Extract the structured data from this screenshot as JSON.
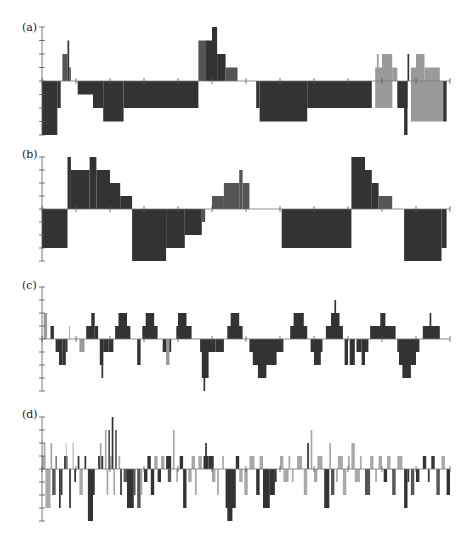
{
  "chart_data": [
    {
      "type": "bar",
      "label": "(a)",
      "xlim": [
        0,
        120
      ],
      "ylim": [
        -4,
        4
      ],
      "x_ticks": [
        0,
        10,
        20,
        30,
        40,
        50,
        60,
        70,
        80,
        90,
        100,
        110,
        120
      ],
      "colors": {
        "dark": "#333333",
        "mid": "#555555",
        "light": "#9a9a9a"
      },
      "segments": [
        [
          0,
          4.5,
          -4,
          "dark"
        ],
        [
          4.5,
          5.5,
          -2,
          "dark"
        ],
        [
          6,
          7.5,
          2,
          "mid"
        ],
        [
          7.5,
          8,
          3,
          "dark"
        ],
        [
          8,
          8.5,
          1,
          "mid"
        ],
        [
          10.5,
          15,
          -1,
          "dark"
        ],
        [
          15,
          18,
          -2,
          "dark"
        ],
        [
          18,
          24,
          -3,
          "dark"
        ],
        [
          24,
          46,
          -2,
          "dark"
        ],
        [
          46,
          48,
          3,
          "mid"
        ],
        [
          48,
          50,
          3,
          "dark"
        ],
        [
          50,
          51.5,
          4,
          "dark"
        ],
        [
          51.5,
          54,
          2,
          "dark"
        ],
        [
          54,
          57.5,
          1,
          "mid"
        ],
        [
          63,
          64,
          -2,
          "dark"
        ],
        [
          64,
          78,
          -3,
          "dark"
        ],
        [
          78,
          97,
          -2,
          "dark"
        ],
        [
          98,
          100,
          1,
          "light"
        ],
        [
          98.5,
          99,
          2,
          "light"
        ],
        [
          100,
          103,
          2,
          "light"
        ],
        [
          100,
          103,
          -2,
          "light"
        ],
        [
          103,
          104.5,
          1,
          "light"
        ],
        [
          98,
          103,
          -2,
          "light"
        ],
        [
          104.5,
          107.5,
          -2,
          "dark"
        ],
        [
          106.5,
          107.5,
          -4,
          "dark"
        ],
        [
          107.5,
          108,
          2,
          "dark"
        ],
        [
          108.5,
          110,
          1,
          "light"
        ],
        [
          110,
          112.5,
          2,
          "light"
        ],
        [
          112.5,
          117,
          1,
          "light"
        ],
        [
          108.5,
          118,
          -3,
          "light"
        ],
        [
          118,
          119,
          -3,
          "dark"
        ]
      ]
    },
    {
      "type": "bar",
      "label": "(b)",
      "xlim": [
        0,
        120
      ],
      "ylim": [
        -4,
        4
      ],
      "x_ticks": [
        0,
        10,
        20,
        30,
        40,
        50,
        60,
        70,
        80,
        90,
        100,
        110,
        120
      ],
      "colors": {
        "dark": "#333333",
        "mid": "#555555",
        "light": "#9a9a9a"
      },
      "segments": [
        [
          0,
          7.5,
          -3,
          "dark"
        ],
        [
          7.5,
          8.5,
          4,
          "dark"
        ],
        [
          8.5,
          14,
          3,
          "dark"
        ],
        [
          14,
          16,
          4,
          "dark"
        ],
        [
          16,
          20,
          3,
          "dark"
        ],
        [
          20,
          23,
          2,
          "dark"
        ],
        [
          23,
          26.5,
          1,
          "dark"
        ],
        [
          26.5,
          36.5,
          -4,
          "dark"
        ],
        [
          36.5,
          42,
          -3,
          "dark"
        ],
        [
          42,
          47,
          -2,
          "dark"
        ],
        [
          47,
          48,
          -1,
          "mid"
        ],
        [
          50,
          53.5,
          1,
          "mid"
        ],
        [
          53.5,
          58,
          2,
          "mid"
        ],
        [
          58,
          59,
          3,
          "mid"
        ],
        [
          59,
          61,
          2,
          "mid"
        ],
        [
          70.5,
          91,
          -3,
          "dark"
        ],
        [
          91,
          95,
          4,
          "dark"
        ],
        [
          93,
          93.5,
          3,
          "dark"
        ],
        [
          95,
          97,
          3,
          "dark"
        ],
        [
          97,
          99,
          2,
          "dark"
        ],
        [
          99,
          103,
          1,
          "mid"
        ],
        [
          106.5,
          117.5,
          -4,
          "dark"
        ],
        [
          117.5,
          119,
          -3,
          "dark"
        ]
      ]
    },
    {
      "type": "bar",
      "label": "(c)",
      "xlim": [
        0,
        120
      ],
      "ylim": [
        -4,
        4
      ],
      "x_ticks": [
        0,
        10,
        20,
        30,
        40,
        50,
        60,
        70,
        80,
        90,
        100,
        110,
        120
      ],
      "colors": {
        "dark": "#333333",
        "mid": "#555555",
        "light": "#9a9a9a"
      },
      "segments": [
        [
          0.5,
          1.5,
          2,
          "light"
        ],
        [
          2.5,
          3.5,
          1,
          "dark"
        ],
        [
          4,
          5,
          -1,
          "dark"
        ],
        [
          5,
          6,
          -2,
          "dark"
        ],
        [
          6,
          7,
          -2,
          "dark"
        ],
        [
          7,
          7.5,
          -1,
          "dark"
        ],
        [
          8,
          8.2,
          1,
          "light"
        ],
        [
          11,
          12.5,
          -1,
          "light"
        ],
        [
          13,
          15,
          1,
          "dark"
        ],
        [
          14.5,
          15.5,
          2,
          "dark"
        ],
        [
          15.5,
          16.5,
          1,
          "dark"
        ],
        [
          17,
          18,
          -2,
          "dark"
        ],
        [
          17.5,
          18,
          -3,
          "dark"
        ],
        [
          18,
          19.5,
          -1,
          "dark"
        ],
        [
          19.5,
          21,
          -1,
          "dark"
        ],
        [
          21.5,
          26,
          1,
          "dark"
        ],
        [
          22.5,
          25,
          2,
          "dark"
        ],
        [
          28,
          29,
          -2,
          "dark"
        ],
        [
          29.5,
          34,
          1,
          "dark"
        ],
        [
          30.5,
          33,
          2,
          "dark"
        ],
        [
          35.5,
          38,
          -1,
          "dark"
        ],
        [
          36.5,
          37.5,
          -2,
          "light"
        ],
        [
          39.5,
          44,
          1,
          "dark"
        ],
        [
          40,
          42.5,
          2,
          "dark"
        ],
        [
          46.5,
          51,
          -1,
          "dark"
        ],
        [
          47,
          49,
          -3,
          "dark"
        ],
        [
          47.5,
          48,
          -4,
          "dark"
        ],
        [
          51,
          53.5,
          -1,
          "dark"
        ],
        [
          54.5,
          59,
          1,
          "dark"
        ],
        [
          55.5,
          58,
          2,
          "dark"
        ],
        [
          61,
          71,
          -1,
          "dark"
        ],
        [
          62,
          69,
          -2,
          "dark"
        ],
        [
          63.5,
          66,
          -3,
          "dark"
        ],
        [
          73,
          78,
          1,
          "dark"
        ],
        [
          74,
          77,
          2,
          "dark"
        ],
        [
          79,
          82.5,
          -1,
          "dark"
        ],
        [
          80,
          82,
          -2,
          "dark"
        ],
        [
          83.5,
          88.5,
          1,
          "dark"
        ],
        [
          85,
          87.5,
          2,
          "dark"
        ],
        [
          86,
          86.5,
          3,
          "dark"
        ],
        [
          89,
          90,
          -2,
          "dark"
        ],
        [
          90.5,
          92,
          -2,
          "dark"
        ],
        [
          92.5,
          94,
          -1,
          "dark"
        ],
        [
          94,
          95,
          -2,
          "dark"
        ],
        [
          95,
          96,
          -1,
          "dark"
        ],
        [
          96.5,
          104,
          1,
          "dark"
        ],
        [
          99.5,
          101,
          2,
          "dark"
        ],
        [
          104.5,
          111,
          -1,
          "dark"
        ],
        [
          105,
          110,
          -2,
          "dark"
        ],
        [
          106,
          108.5,
          -3,
          "dark"
        ],
        [
          112,
          117,
          1,
          "dark"
        ],
        [
          114,
          114.5,
          2,
          "dark"
        ]
      ]
    },
    {
      "type": "bar",
      "label": "(d)",
      "xlim": [
        0,
        120
      ],
      "ylim": [
        -4,
        4
      ],
      "x_ticks": [
        0,
        10,
        20,
        30,
        40,
        50,
        60,
        70,
        80,
        90,
        100,
        110,
        120
      ],
      "colors": {
        "dark": "#333333",
        "mid": "#555555",
        "light": "#a8a8a8"
      },
      "segments": [
        [
          0,
          1,
          1,
          "light"
        ],
        [
          0.5,
          1,
          2,
          "light"
        ],
        [
          1,
          2.5,
          -3,
          "light"
        ],
        [
          2.5,
          3,
          2,
          "light"
        ],
        [
          3,
          4,
          -2,
          "mid"
        ],
        [
          4,
          4.3,
          1,
          "dark"
        ],
        [
          5,
          5.5,
          -3,
          "dark"
        ],
        [
          5.5,
          6,
          -2,
          "dark"
        ],
        [
          6.5,
          7.5,
          1,
          "dark"
        ],
        [
          7,
          7.2,
          2,
          "light"
        ],
        [
          8,
          8.5,
          -3,
          "dark"
        ],
        [
          9,
          9.3,
          2,
          "light"
        ],
        [
          9.5,
          10,
          -1,
          "dark"
        ],
        [
          10.5,
          11,
          1,
          "dark"
        ],
        [
          11,
          12,
          -2,
          "light"
        ],
        [
          12.5,
          13,
          1,
          "dark"
        ],
        [
          13.5,
          15,
          -4,
          "dark"
        ],
        [
          15,
          15.5,
          -2,
          "dark"
        ],
        [
          16.5,
          18,
          1,
          "dark"
        ],
        [
          17,
          17.5,
          2,
          "light"
        ],
        [
          18.5,
          19,
          3,
          "light"
        ],
        [
          19,
          19.5,
          -2,
          "light"
        ],
        [
          19.5,
          20,
          3,
          "mid"
        ],
        [
          20,
          20.5,
          1,
          "light"
        ],
        [
          20.5,
          21,
          4,
          "dark"
        ],
        [
          21,
          21.5,
          -2,
          "light"
        ],
        [
          21.5,
          22,
          3,
          "mid"
        ],
        [
          22.5,
          23,
          1,
          "light"
        ],
        [
          23,
          23.5,
          -2,
          "dark"
        ],
        [
          24,
          25,
          -1,
          "mid"
        ],
        [
          25,
          27,
          -3,
          "dark"
        ],
        [
          27,
          27.5,
          -2,
          "mid"
        ],
        [
          28,
          29,
          -3,
          "mid"
        ],
        [
          29,
          29.5,
          -2,
          "light"
        ],
        [
          30,
          31,
          -1,
          "dark"
        ],
        [
          31,
          32,
          1,
          "dark"
        ],
        [
          32,
          33,
          -2,
          "dark"
        ],
        [
          33,
          34,
          1,
          "light"
        ],
        [
          34,
          35,
          -1,
          "dark"
        ],
        [
          35,
          36,
          1,
          "light"
        ],
        [
          36.5,
          38,
          1,
          "dark"
        ],
        [
          37,
          38,
          -1,
          "mid"
        ],
        [
          38.5,
          39,
          3,
          "light"
        ],
        [
          39.5,
          40,
          -1,
          "light"
        ],
        [
          40.5,
          41.5,
          1,
          "dark"
        ],
        [
          41.5,
          42.5,
          -3,
          "dark"
        ],
        [
          43,
          44,
          -1,
          "light"
        ],
        [
          44,
          45,
          1,
          "light"
        ],
        [
          45,
          45.5,
          -2,
          "light"
        ],
        [
          46,
          47,
          1,
          "light"
        ],
        [
          47.5,
          49,
          1,
          "dark"
        ],
        [
          48,
          48.5,
          2,
          "dark"
        ],
        [
          49,
          50.5,
          1,
          "dark"
        ],
        [
          50,
          51,
          -1,
          "light"
        ],
        [
          51.5,
          52,
          -2,
          "light"
        ],
        [
          53,
          53.5,
          1,
          "light"
        ],
        [
          54,
          57,
          -3,
          "dark"
        ],
        [
          54.5,
          56,
          -4,
          "dark"
        ],
        [
          57,
          58,
          1,
          "dark"
        ],
        [
          58,
          59,
          -1,
          "light"
        ],
        [
          59.5,
          60.5,
          -2,
          "light"
        ],
        [
          61,
          62.5,
          1,
          "light"
        ],
        [
          63,
          64,
          -2,
          "dark"
        ],
        [
          64,
          65,
          1,
          "light"
        ],
        [
          65,
          67,
          -3,
          "dark"
        ],
        [
          67,
          68.5,
          -2,
          "dark"
        ],
        [
          68.5,
          69,
          -1,
          "dark"
        ],
        [
          70,
          71,
          1,
          "light"
        ],
        [
          71,
          72.5,
          -1,
          "light"
        ],
        [
          72.5,
          73,
          1,
          "light"
        ],
        [
          73.5,
          74,
          -1,
          "light"
        ],
        [
          75,
          76.5,
          1,
          "light"
        ],
        [
          77,
          78,
          -2,
          "light"
        ],
        [
          78,
          78.5,
          2,
          "dark"
        ],
        [
          79,
          79.5,
          3,
          "light"
        ],
        [
          80,
          81,
          -1,
          "light"
        ],
        [
          81,
          82.5,
          1,
          "light"
        ],
        [
          83,
          84.5,
          -3,
          "dark"
        ],
        [
          84.5,
          85,
          2,
          "light"
        ],
        [
          85,
          86,
          -2,
          "mid"
        ],
        [
          86.5,
          87,
          -1,
          "light"
        ],
        [
          87,
          88.5,
          1,
          "light"
        ],
        [
          88.5,
          89.5,
          -2,
          "light"
        ],
        [
          90,
          90.5,
          1,
          "light"
        ],
        [
          91,
          92,
          2,
          "light"
        ],
        [
          92,
          93.5,
          -1,
          "light"
        ],
        [
          93.5,
          94,
          1,
          "light"
        ],
        [
          95,
          96.5,
          -2,
          "mid"
        ],
        [
          96.5,
          97.5,
          1,
          "light"
        ],
        [
          98,
          98.5,
          -1,
          "light"
        ],
        [
          99,
          100,
          1,
          "light"
        ],
        [
          100.5,
          101.5,
          -1,
          "dark"
        ],
        [
          101.5,
          102.5,
          1,
          "light"
        ],
        [
          103,
          104,
          -2,
          "mid"
        ],
        [
          104.5,
          106,
          1,
          "light"
        ],
        [
          106.5,
          107.5,
          -3,
          "dark"
        ],
        [
          107.5,
          108,
          -1,
          "dark"
        ],
        [
          108.5,
          109.5,
          -2,
          "mid"
        ],
        [
          110,
          111,
          -1,
          "dark"
        ],
        [
          112,
          113,
          1,
          "dark"
        ],
        [
          113.5,
          114,
          -1,
          "dark"
        ],
        [
          114.5,
          115.5,
          1,
          "dark"
        ],
        [
          116,
          117,
          -2,
          "mid"
        ],
        [
          117.5,
          118.5,
          1,
          "light"
        ],
        [
          119,
          120,
          -2,
          "dark"
        ]
      ]
    }
  ]
}
